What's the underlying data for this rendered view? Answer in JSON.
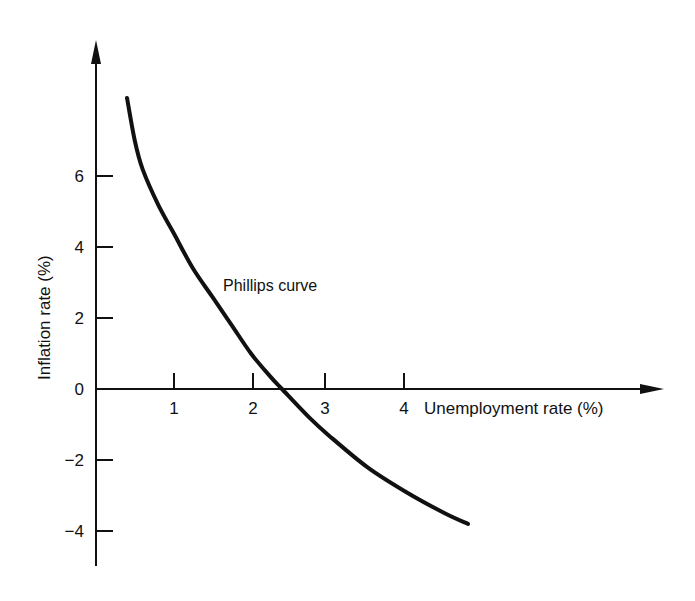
{
  "chart_data": {
    "type": "line",
    "title": "",
    "xlabel": "Unemployment rate (%)",
    "ylabel": "Inflation rate (%)",
    "x_ticks": [
      "1",
      "2",
      "3",
      "4"
    ],
    "y_ticks": [
      "6",
      "4",
      "2",
      "0",
      "−2",
      "−4"
    ],
    "xlim": [
      0,
      5.2
    ],
    "ylim": [
      -5,
      9
    ],
    "grid": false,
    "legend": null,
    "annotations": [
      {
        "text": "Phillips curve",
        "x": 2.3,
        "y": 3.0
      }
    ],
    "series": [
      {
        "name": "Phillips curve",
        "x": [
          0.4,
          0.5,
          0.6,
          0.8,
          1.0,
          1.25,
          1.5,
          1.75,
          2.0,
          2.25,
          2.4,
          2.75,
          3.0,
          3.5,
          4.0,
          4.5,
          4.8
        ],
        "y": [
          8.2,
          7.0,
          6.2,
          5.2,
          4.4,
          3.4,
          2.6,
          1.8,
          1.0,
          0.35,
          0.0,
          -0.8,
          -1.3,
          -2.2,
          -2.9,
          -3.5,
          -3.8
        ]
      }
    ]
  }
}
